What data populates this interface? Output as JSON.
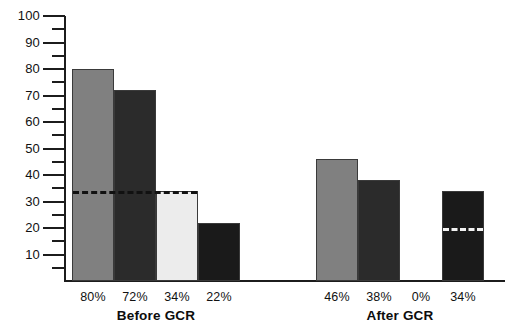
{
  "chart_data": {
    "type": "bar",
    "title": "",
    "xlabel": "",
    "ylabel": "",
    "ylim": [
      0,
      100
    ],
    "grid": false,
    "legend": "none",
    "y_major_step": 10,
    "y_minor_step": 5,
    "y_tick_labels": [
      "100",
      "90",
      "80",
      "70",
      "60",
      "50",
      "40",
      "30",
      "20",
      "10"
    ],
    "y_tick_values": [
      100,
      90,
      80,
      70,
      60,
      50,
      40,
      30,
      20,
      10
    ],
    "groups": [
      {
        "name": "Before GCR",
        "label": "Before GCR",
        "categories": [
          "80%",
          "72%",
          "34%",
          "22%"
        ],
        "values": [
          80,
          72,
          34,
          22
        ],
        "colors": [
          "#808080",
          "#2b2b2b",
          "#ececec",
          "#1a1a1a"
        ],
        "reference_line": {
          "value": 34,
          "style": "dashed",
          "color": "#111111",
          "spans_bars": [
            0,
            1,
            2
          ]
        }
      },
      {
        "name": "After GCR",
        "label": "After GCR",
        "categories": [
          "46%",
          "38%",
          "0%",
          "34%"
        ],
        "values": [
          46,
          38,
          0,
          34
        ],
        "colors": [
          "#808080",
          "#2b2b2b",
          "#ffffff",
          "#1a1a1a"
        ],
        "reference_line": {
          "value": 20,
          "style": "dashed",
          "color": "#f2f2f2",
          "spans_bars": [
            3
          ]
        }
      }
    ]
  }
}
